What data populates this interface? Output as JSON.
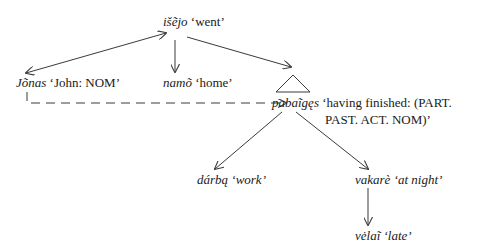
{
  "diagram": {
    "nodes": {
      "isejo": {
        "word": "išẽjo",
        "gloss": "‘went’"
      },
      "jonas": {
        "word": "Jõnas",
        "gloss": "‘John: NOM’"
      },
      "namo": {
        "word": "namõ",
        "gloss": "‘home’"
      },
      "pabaiges": {
        "word": "pabaĩgęs",
        "gloss_line1": "‘having finished: (PART.",
        "gloss_line2": "PAST. ACT. NOM)’"
      },
      "darba": {
        "word": "dárbą",
        "gloss": "‘work’"
      },
      "vakare": {
        "word": "vakarè",
        "gloss": "‘at night’"
      },
      "velai": {
        "word": "vėlaĩ",
        "gloss": "‘late’"
      }
    },
    "edges": [
      {
        "from": "isejo",
        "to": "jonas",
        "style": "solid",
        "arrows": "both"
      },
      {
        "from": "isejo",
        "to": "namo",
        "style": "solid",
        "arrows": "end"
      },
      {
        "from": "isejo",
        "to": "pabaiges",
        "style": "solid",
        "arrows": "end",
        "note": "to triangle"
      },
      {
        "from": "jonas",
        "to": "pabaiges",
        "style": "dashed",
        "arrows": "end"
      },
      {
        "from": "pabaiges",
        "to": "darba",
        "style": "solid",
        "arrows": "end"
      },
      {
        "from": "pabaiges",
        "to": "vakare",
        "style": "solid",
        "arrows": "end"
      },
      {
        "from": "vakare",
        "to": "velai",
        "style": "solid",
        "arrows": "end"
      }
    ],
    "colors": {
      "ink": "#1a1a1a",
      "line": "#3a3a3a",
      "background": "#ffffff"
    }
  }
}
